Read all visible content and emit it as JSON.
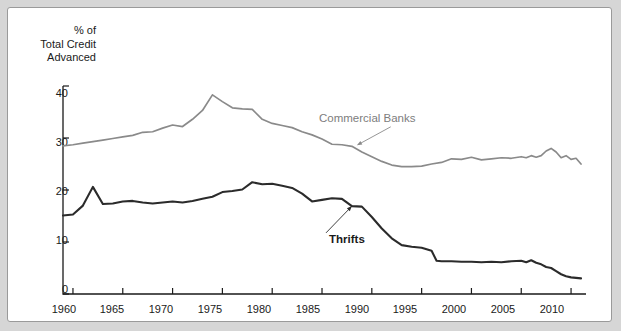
{
  "chart_data": {
    "type": "line",
    "title": "",
    "ylabel": "% of\nTotal Credit\nAdvanced",
    "xlabel": "",
    "xlim": [
      1959,
      2011.5
    ],
    "ylim": [
      0,
      40
    ],
    "yticks": [
      0,
      10,
      20,
      30,
      40
    ],
    "xticks": [
      1960,
      1965,
      1970,
      1975,
      1980,
      1985,
      1990,
      1995,
      2000,
      2005,
      2010
    ],
    "grid": false,
    "legend_position": "inline-annotations",
    "series": [
      {
        "name": "Commercial Banks",
        "color": "#8a8a8a",
        "label_x": 1992.5,
        "label_y": 33.5,
        "annotation_arrow_to": [
          1988.5,
          28.6
        ],
        "points": [
          [
            1959.0,
            28.5
          ],
          [
            1960.0,
            28.7
          ],
          [
            1961.0,
            29.0
          ],
          [
            1962.0,
            29.3
          ],
          [
            1963.0,
            29.6
          ],
          [
            1964.0,
            29.9
          ],
          [
            1965.0,
            30.2
          ],
          [
            1966.0,
            30.5
          ],
          [
            1967.0,
            31.1
          ],
          [
            1968.0,
            31.2
          ],
          [
            1969.0,
            31.9
          ],
          [
            1970.0,
            32.5
          ],
          [
            1971.0,
            32.2
          ],
          [
            1972.0,
            33.6
          ],
          [
            1973.0,
            35.3
          ],
          [
            1974.0,
            38.3
          ],
          [
            1975.0,
            37.0
          ],
          [
            1976.0,
            35.8
          ],
          [
            1977.0,
            35.6
          ],
          [
            1978.0,
            35.5
          ],
          [
            1979.0,
            33.6
          ],
          [
            1980.0,
            32.8
          ],
          [
            1981.0,
            32.4
          ],
          [
            1982.0,
            32.0
          ],
          [
            1983.0,
            31.2
          ],
          [
            1984.0,
            30.6
          ],
          [
            1985.0,
            29.8
          ],
          [
            1986.0,
            28.8
          ],
          [
            1987.0,
            28.7
          ],
          [
            1988.0,
            28.4
          ],
          [
            1989.0,
            27.3
          ],
          [
            1990.0,
            26.4
          ],
          [
            1991.0,
            25.5
          ],
          [
            1992.0,
            24.8
          ],
          [
            1993.0,
            24.5
          ],
          [
            1994.0,
            24.5
          ],
          [
            1995.0,
            24.6
          ],
          [
            1996.0,
            25.0
          ],
          [
            1997.0,
            25.3
          ],
          [
            1998.0,
            26.0
          ],
          [
            1999.0,
            25.9
          ],
          [
            2000.0,
            26.3
          ],
          [
            2001.0,
            25.8
          ],
          [
            2002.0,
            26.0
          ],
          [
            2003.0,
            26.2
          ],
          [
            2004.0,
            26.1
          ],
          [
            2005.0,
            26.4
          ],
          [
            2005.5,
            26.2
          ],
          [
            2006.0,
            26.6
          ],
          [
            2006.5,
            26.3
          ],
          [
            2007.0,
            26.6
          ],
          [
            2007.5,
            27.5
          ],
          [
            2008.0,
            28.0
          ],
          [
            2008.5,
            27.3
          ],
          [
            2009.0,
            26.2
          ],
          [
            2009.5,
            26.6
          ],
          [
            2010.0,
            25.9
          ],
          [
            2010.5,
            26.1
          ],
          [
            2011.0,
            25.0
          ]
        ]
      },
      {
        "name": "Thrifts",
        "color": "#2b2b2b",
        "label_x": 1985.0,
        "label_y": 10.6,
        "annotation_arrow_to": [
          1988.0,
          16.9
        ],
        "points": [
          [
            1959.0,
            15.1
          ],
          [
            1960.0,
            15.3
          ],
          [
            1961.0,
            17.0
          ],
          [
            1962.0,
            20.6
          ],
          [
            1963.0,
            17.3
          ],
          [
            1964.0,
            17.4
          ],
          [
            1965.0,
            17.8
          ],
          [
            1966.0,
            17.9
          ],
          [
            1967.0,
            17.6
          ],
          [
            1968.0,
            17.4
          ],
          [
            1969.0,
            17.6
          ],
          [
            1970.0,
            17.8
          ],
          [
            1971.0,
            17.6
          ],
          [
            1972.0,
            17.9
          ],
          [
            1973.0,
            18.3
          ],
          [
            1974.0,
            18.7
          ],
          [
            1975.0,
            19.6
          ],
          [
            1976.0,
            19.8
          ],
          [
            1977.0,
            20.1
          ],
          [
            1978.0,
            21.5
          ],
          [
            1979.0,
            21.1
          ],
          [
            1980.0,
            21.2
          ],
          [
            1981.0,
            20.8
          ],
          [
            1982.0,
            20.4
          ],
          [
            1983.0,
            19.3
          ],
          [
            1984.0,
            17.8
          ],
          [
            1985.0,
            18.1
          ],
          [
            1986.0,
            18.4
          ],
          [
            1987.0,
            18.3
          ],
          [
            1988.0,
            16.9
          ],
          [
            1989.0,
            16.8
          ],
          [
            1990.0,
            14.8
          ],
          [
            1991.0,
            12.6
          ],
          [
            1992.0,
            10.7
          ],
          [
            1993.0,
            9.4
          ],
          [
            1994.0,
            9.1
          ],
          [
            1995.0,
            8.9
          ],
          [
            1996.0,
            8.3
          ],
          [
            1996.5,
            6.4
          ],
          [
            1997.0,
            6.3
          ],
          [
            1998.0,
            6.3
          ],
          [
            1999.0,
            6.2
          ],
          [
            2000.0,
            6.2
          ],
          [
            2001.0,
            6.1
          ],
          [
            2002.0,
            6.2
          ],
          [
            2003.0,
            6.1
          ],
          [
            2004.0,
            6.3
          ],
          [
            2005.0,
            6.4
          ],
          [
            2005.5,
            6.1
          ],
          [
            2006.0,
            6.5
          ],
          [
            2006.5,
            6.0
          ],
          [
            2007.0,
            5.7
          ],
          [
            2007.5,
            5.2
          ],
          [
            2008.0,
            5.0
          ],
          [
            2008.5,
            4.4
          ],
          [
            2009.0,
            3.8
          ],
          [
            2009.5,
            3.4
          ],
          [
            2010.0,
            3.2
          ],
          [
            2010.5,
            3.1
          ],
          [
            2011.0,
            3.0
          ]
        ]
      }
    ]
  },
  "axis": {
    "y_title": "% of\nTotal Credit\nAdvanced",
    "y_labels": [
      "40",
      "30",
      "20",
      "10",
      "0"
    ],
    "x_labels": [
      "1960",
      "1965",
      "1970",
      "1975",
      "1980",
      "1985",
      "1990",
      "1995",
      "2000",
      "2005",
      "2010"
    ]
  },
  "labels": {
    "commercial_banks": "Commercial Banks",
    "thrifts": "Thrifts"
  },
  "colors": {
    "commercial_banks": "#8a8a8a",
    "thrifts": "#2b2b2b",
    "axis": "#1a1a1a",
    "panel_background": "#ffffff",
    "page_background": "#d6d6d6"
  }
}
